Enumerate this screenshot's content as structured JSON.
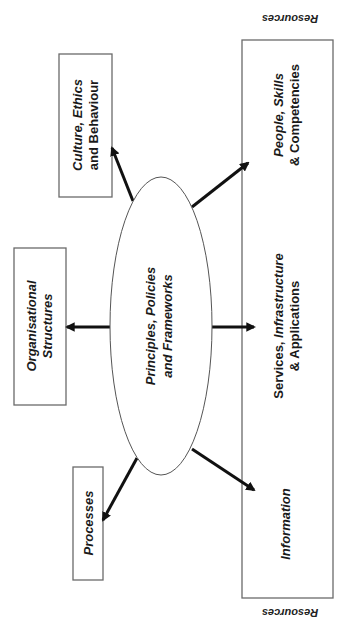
{
  "diagram": {
    "orientation": "rotated-90-ccw",
    "colors": {
      "stroke": "#6a6a6a",
      "arrow": "#111111",
      "text": "#1a1a1a",
      "background": "#ffffff"
    },
    "center": {
      "line1": "Principles, Policies",
      "line2": "and Frameworks"
    },
    "boxes": {
      "culture": {
        "line1_a": "Culture, ",
        "line1_b": "Ethics",
        "line2": "and Behaviour"
      },
      "organisational": {
        "line1": "Organisational",
        "line2": "Structures"
      },
      "processes": {
        "line1": "Processes"
      }
    },
    "resources": {
      "label_top": "Resources",
      "label_bottom": "Resources",
      "sections": {
        "people": {
          "line1": "People, Skills",
          "line2": "& Competencies"
        },
        "services": {
          "line1_a": "Services, ",
          "line1_b": "Infrastructure",
          "line2": "& Applications"
        },
        "information": {
          "line1": "Information"
        }
      }
    }
  }
}
